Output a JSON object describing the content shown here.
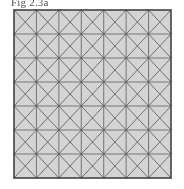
{
  "page": {
    "background_color": "#ffffff",
    "width": 184,
    "height": 189
  },
  "caption": {
    "text": "Fig 2.3a",
    "color": "#2b2b2b"
  },
  "figure": {
    "name": "triangulated-square-mesh",
    "fill_color": "#d2d2d2",
    "line_color": "#555555",
    "border_color": "#3a3a3a",
    "border_width": 1.6,
    "grid_line_width": 0.8,
    "diagonal_line_width": 0.85,
    "columns": 7,
    "rows": 7,
    "show_horizontal_grid_lines": true,
    "show_vertical_grid_lines": true,
    "show_diagonals": true,
    "diagonal_mode": "both",
    "bounds": {
      "x": 2,
      "y": 2,
      "width": 157,
      "height": 168
    }
  },
  "chart_data": {
    "type": "diagram",
    "subtype": "finite-element-mesh",
    "title": "Fig 2.3a",
    "xlabel": "",
    "ylabel": "",
    "grid": true,
    "legend": null,
    "nx": 7,
    "ny": 7,
    "cell_width": 22.43,
    "cell_height": 24.0,
    "total_cells": 49,
    "total_triangles": 196,
    "total_nodes": 113,
    "x_nodes": [
      0,
      22.43,
      44.86,
      67.29,
      89.71,
      112.14,
      134.57,
      157
    ],
    "y_nodes": [
      0,
      24,
      48,
      72,
      96,
      120,
      144,
      168
    ],
    "xlim": [
      0,
      157
    ],
    "ylim": [
      0,
      168
    ],
    "annotations": [
      {
        "text": "Fig 2.3a",
        "position": "above-left"
      }
    ]
  }
}
